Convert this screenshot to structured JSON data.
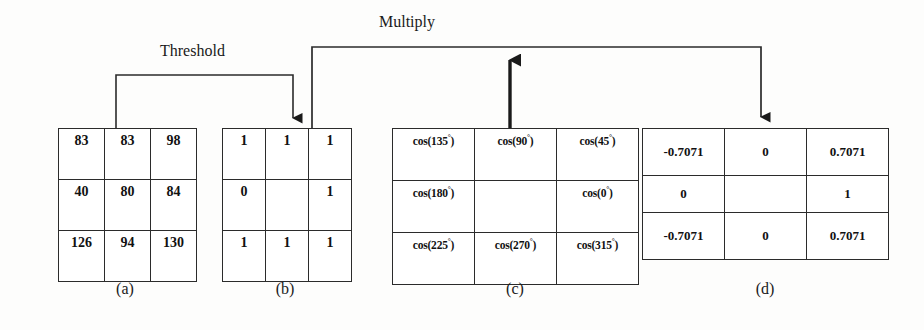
{
  "figure": {
    "background_color": "#fdfdfc",
    "line_color": "#2b2b2b"
  },
  "connectors": [
    {
      "name": "threshold",
      "label": "Threshold",
      "from": "matrix-a",
      "to": "matrix-b",
      "direction": "down"
    },
    {
      "name": "multiply",
      "label": "Multiply",
      "from": "matrix-b",
      "to": "matrix-d",
      "second_input": "matrix-c",
      "direction": "down"
    }
  ],
  "matrices": {
    "a": {
      "caption": "(a)",
      "rows": [
        [
          "83",
          "83",
          "98"
        ],
        [
          "40",
          "80",
          "84"
        ],
        [
          "126",
          "94",
          "130"
        ]
      ]
    },
    "b": {
      "caption": "(b)",
      "rows": [
        [
          "1",
          "1",
          "1"
        ],
        [
          "0",
          "",
          "1"
        ],
        [
          "1",
          "1",
          "1"
        ]
      ]
    },
    "c": {
      "caption": "(c)",
      "rows": [
        [
          "cos(135°)",
          "cos(90°)",
          "cos(45°)"
        ],
        [
          "cos(180°)",
          "",
          "cos(0°)"
        ],
        [
          "cos(225°)",
          "cos(270°)",
          "cos(315°)"
        ]
      ]
    },
    "d": {
      "caption": "(d)",
      "rows": [
        [
          "-0.7071",
          "0",
          "0.7071"
        ],
        [
          "0",
          "",
          "1"
        ],
        [
          "-0.7071",
          "0",
          "0.7071"
        ]
      ]
    }
  }
}
